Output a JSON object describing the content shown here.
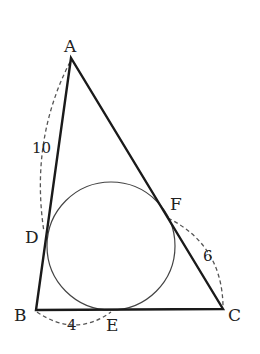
{
  "diagram": {
    "type": "triangle-incircle",
    "vertices": {
      "A": {
        "label": "A",
        "x": 71,
        "y": 58
      },
      "B": {
        "label": "B",
        "x": 36,
        "y": 310
      },
      "C": {
        "label": "C",
        "x": 223,
        "y": 309
      }
    },
    "tangent_points": {
      "D": {
        "label": "D",
        "x": 46,
        "y": 234
      },
      "E": {
        "label": "E",
        "x": 112,
        "y": 309
      },
      "F": {
        "label": "F",
        "x": 167,
        "y": 215
      }
    },
    "incircle": {
      "cx": 111,
      "cy": 246,
      "r": 64
    },
    "measurements": {
      "AD": "10",
      "BE": "4",
      "CF": "6"
    },
    "colors": {
      "line": "#1a1a1a",
      "circle": "#444444",
      "dash": "#555555"
    }
  }
}
